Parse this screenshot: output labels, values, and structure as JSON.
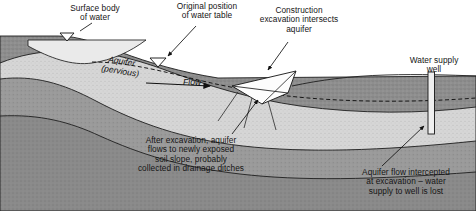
{
  "diagram": {
    "type": "geological-cross-section",
    "colors": {
      "topsoil": "#8e8e8e",
      "aquifer": "#d6d6d6",
      "bedrock": "#9a9a9a",
      "deep_stratum": "#8a8a8a",
      "surface_water": "#e8e8e8",
      "excavation": "#fdfdfd",
      "outline": "#1e1e1e",
      "text": "#151515"
    },
    "labels": {
      "surface_water": "Surface body\nof water",
      "original_water_table": "Original position\nof water table",
      "construction": "Construction\nexcavation intersects\naquifer",
      "well": "Water supply\nwell",
      "aquifer": "Aquifer\n(pervious)",
      "flow": "Flow",
      "after_excavation": "After excavation, aquifer\nflows to newly exposed\nsoil slope, probably\ncollected in drainage ditches",
      "intercepted": "Aquifer flow intercepted\nat excavation – water\nsupply to well is lost"
    },
    "markers": {
      "water_table_symbol": "water-table-triangle",
      "flow_direction": "left-to-right"
    }
  }
}
